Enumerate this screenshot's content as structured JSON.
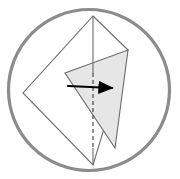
{
  "figure": {
    "background_color": "#ffffff",
    "width": 180,
    "height": 179
  },
  "circle": {
    "name": "outer circle border",
    "center_x": 89,
    "center_y": 90,
    "radius": 80.5,
    "stroke_color": "#8c8c8c",
    "stroke_width": 3.2,
    "fill": "none"
  },
  "paper": {
    "name": "kite outline",
    "stroke_color": "#6b6b6b",
    "stroke_width": 1.1,
    "fill": "#ffffff",
    "vertices": [
      {
        "label": "top",
        "x": 93,
        "y": 16
      },
      {
        "label": "right",
        "x": 128,
        "y": 50
      },
      {
        "label": "bottom",
        "x": 93,
        "y": 165
      },
      {
        "label": "left",
        "x": 23,
        "y": 93
      }
    ]
  },
  "shaded_flap": {
    "name": "shaded triangular flap",
    "fill_color": "#e6e6e6",
    "stroke_color": "#6b6b6b",
    "stroke_width": 1.1,
    "vertices": [
      {
        "label": "flap-left",
        "x": 65,
        "y": 73
      },
      {
        "label": "flap-top-right",
        "x": 128,
        "y": 50
      },
      {
        "label": "flap-bottom",
        "x": 115,
        "y": 148
      }
    ]
  },
  "center_axis": {
    "name": "vertical center line",
    "x": 93,
    "top_y": 16,
    "bottom_y": 165,
    "solid_color": "#6b6b6b",
    "dashed_color": "#3a3a3a",
    "dash_pattern": "4 3",
    "dash_start_y": 73,
    "dash_end_y": 148,
    "stroke_width": 1.1
  },
  "fold_arrow": {
    "name": "fold direction arrow",
    "color": "#000000",
    "stroke_width": 2.2,
    "start_x": 68,
    "start_y": 86,
    "end_x": 112,
    "end_y": 88,
    "head_length": 12,
    "head_width": 9,
    "direction": "left-to-right"
  },
  "edges": [
    {
      "name": "top-left-edge",
      "from": "top",
      "to": "left"
    },
    {
      "name": "top-right-edge",
      "from": "top",
      "to": "right"
    },
    {
      "name": "bottom-left-edge",
      "from": "left",
      "to": "bottom"
    },
    {
      "name": "right-bottom-edge",
      "from": "right",
      "to": "bottom"
    },
    {
      "name": "flap-crease-edge",
      "from": "flap-left",
      "to": "flap-top-right"
    },
    {
      "name": "flap-lower-edge",
      "from": "flap-left",
      "to": "flap-bottom"
    },
    {
      "name": "flap-right-edge",
      "from": "flap-top-right",
      "to": "flap-bottom"
    }
  ]
}
